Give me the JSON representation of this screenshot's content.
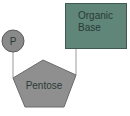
{
  "diagram": {
    "nodes": {
      "phosphate": {
        "label": "P",
        "shape": "circle",
        "color": "#8a8a8a"
      },
      "pentose": {
        "label": "Pentose",
        "shape": "pentagon",
        "color": "#8f8f8f"
      },
      "base": {
        "label_line1": "Organic",
        "label_line2": "Base",
        "shape": "rectangle",
        "color": "#5f8679"
      }
    },
    "edges": [
      {
        "from": "phosphate",
        "to": "pentose"
      },
      {
        "from": "base",
        "to": "pentose"
      }
    ],
    "colors": {
      "line": "#9a9a9a",
      "stroke": "#5a5a5a",
      "text": "#2b3a36"
    }
  }
}
